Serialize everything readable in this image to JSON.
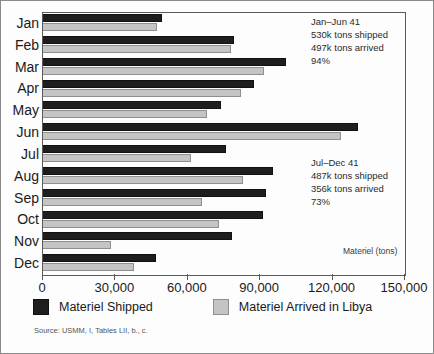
{
  "chart_data": {
    "type": "bar",
    "orientation": "horizontal",
    "title": "",
    "xlabel": "Materiel (tons)",
    "ylabel": "",
    "xlim": [
      0,
      150000
    ],
    "xticks": [
      0,
      30000,
      60000,
      90000,
      120000,
      150000
    ],
    "xticklabels": [
      "0",
      "30,000",
      "60,000",
      "90,000",
      "120,000",
      "150,000"
    ],
    "grid": false,
    "legend_position": "below-axes",
    "categories": [
      "Jan",
      "Feb",
      "Mar",
      "Apr",
      "May",
      "Jun",
      "Jul",
      "Aug",
      "Sep",
      "Oct",
      "Nov",
      "Dec"
    ],
    "series": [
      {
        "name": "Materiel Shipped",
        "color": "#1e1e1e",
        "values": [
          49700,
          79500,
          101000,
          87800,
          74200,
          130800,
          76200,
          95700,
          92800,
          91500,
          78700,
          47200
        ]
      },
      {
        "name": "Materiel Arrived in Libya",
        "color": "#c4c4c4",
        "values": [
          47700,
          78300,
          92000,
          82400,
          68400,
          123900,
          61700,
          83300,
          66300,
          73300,
          28600,
          38100
        ]
      }
    ],
    "annotations": [
      {
        "id": "jan-jun-summary",
        "lines": [
          "Jan–Jun 41",
          "530k tons shipped",
          "497k tons arrived",
          "94%"
        ]
      },
      {
        "id": "jul-dec-summary",
        "lines": [
          "Jul–Dec 41",
          "487k tons shipped",
          "356k tons arrived",
          "73%"
        ]
      }
    ],
    "source": "Source: USMM, I, Tables LII, b., c."
  },
  "legend": {
    "items": [
      {
        "label": "Materiel Shipped",
        "swatch": "shipped"
      },
      {
        "label": "Materiel Arrived in Libya",
        "swatch": "arrived"
      }
    ]
  },
  "annotation_h1": {
    "line1": "Jan–Jun 41",
    "line2": "530k tons shipped",
    "line3": "497k tons arrived",
    "line4": "94%"
  },
  "annotation_h2": {
    "line1": "Jul–Dec 41",
    "line2": "487k tons shipped",
    "line3": "356k tons arrived",
    "line4": "73%"
  },
  "axis_title": "Materiel (tons)",
  "source_note": "Source: USMM, I, Tables LII, b., c."
}
